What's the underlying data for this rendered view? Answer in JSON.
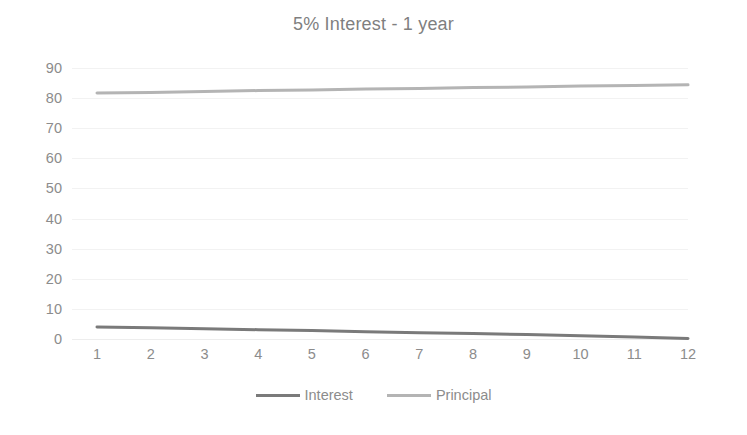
{
  "chart_data": {
    "type": "line",
    "title": "5% Interest - 1 year",
    "xlabel": "",
    "ylabel": "",
    "categories": [
      "1",
      "2",
      "3",
      "4",
      "5",
      "6",
      "7",
      "8",
      "9",
      "10",
      "11",
      "12"
    ],
    "series": [
      {
        "name": "Interest",
        "color": "#7a7a7a",
        "values": [
          4.0,
          3.7,
          3.4,
          3.1,
          2.8,
          2.4,
          2.1,
          1.8,
          1.5,
          1.1,
          0.7,
          0.2
        ]
      },
      {
        "name": "Principal",
        "color": "#b4b4b4",
        "values": [
          81.7,
          81.9,
          82.2,
          82.5,
          82.7,
          83.0,
          83.2,
          83.5,
          83.7,
          84.0,
          84.2,
          84.4
        ]
      }
    ],
    "ylim": [
      0,
      90
    ],
    "ytick_step": 10,
    "yticks": [
      "90",
      "80",
      "70",
      "60",
      "50",
      "40",
      "30",
      "20",
      "10",
      "0"
    ],
    "grid": true,
    "legend_position": "bottom",
    "title_color": "#7f7f7f",
    "axis_label_color": "#8c8c8c",
    "gridline_color": "#f2f2f2",
    "background": "#ffffff"
  }
}
